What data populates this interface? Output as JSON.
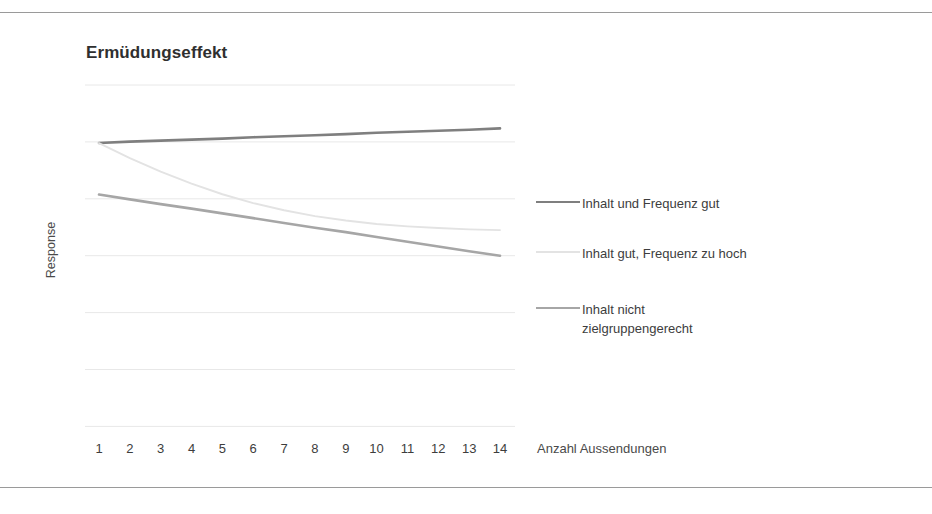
{
  "page": {
    "top_rule": "",
    "bottom_rule": ""
  },
  "chart_data": {
    "type": "line",
    "title": "Ermüdungseffekt",
    "xlabel": "Anzahl Aussendungen",
    "ylabel": "Response",
    "x": [
      1,
      2,
      3,
      4,
      5,
      6,
      7,
      8,
      9,
      10,
      11,
      12,
      13,
      14
    ],
    "categories": [
      "1",
      "2",
      "3",
      "4",
      "5",
      "6",
      "7",
      "8",
      "9",
      "10",
      "11",
      "12",
      "13",
      "14"
    ],
    "xlim": [
      1,
      14
    ],
    "ylim": [
      0,
      100
    ],
    "grid": "horizontal",
    "y_tick_labels_visible": false,
    "legend_position": "right",
    "series": [
      {
        "name": "Inhalt und Frequenz gut",
        "color": "#7f7f7f",
        "values": [
          83.0,
          83.4,
          83.7,
          84.0,
          84.3,
          84.7,
          85.0,
          85.3,
          85.6,
          86.0,
          86.3,
          86.6,
          86.9,
          87.3
        ]
      },
      {
        "name": "Inhalt gut, Frequenz zu hoch",
        "color": "#e3e3e3",
        "values": [
          83.0,
          78.6,
          74.6,
          71.1,
          68.0,
          65.4,
          63.3,
          61.6,
          60.3,
          59.3,
          58.6,
          58.1,
          57.7,
          57.5
        ]
      },
      {
        "name": "Inhalt nicht\nzielgruppengerecht",
        "color": "#a6a6a6",
        "values": [
          67.9,
          66.5,
          65.1,
          63.8,
          62.4,
          61.0,
          59.6,
          58.2,
          56.9,
          55.5,
          54.1,
          52.7,
          51.3,
          50.0
        ]
      }
    ],
    "gridline_count": 7,
    "colors": {
      "grid": "#e8e8e8",
      "rule": "#9a9a9a",
      "title": "#2f2f2f",
      "text": "#3d3d3d"
    }
  }
}
